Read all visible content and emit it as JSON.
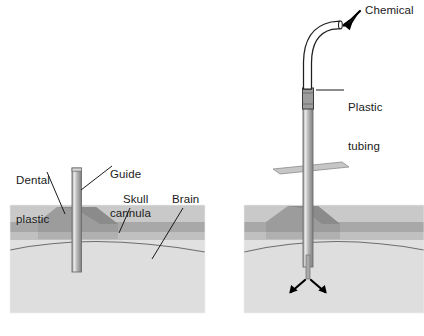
{
  "figure": {
    "panels": [
      {
        "id": "left",
        "name": "implanted-guide-cannula"
      },
      {
        "id": "right",
        "name": "infusion-cannula-with-tubing"
      }
    ]
  },
  "labels": {
    "dental_plastic": "Dental\nplastic",
    "dental_plastic_line1": "Dental",
    "dental_plastic_line2": "plastic",
    "guide_cannula_line1": "Guide",
    "guide_cannula_line2": "cannula",
    "skull": "Skull",
    "brain": "Brain",
    "chemical": "Chemical",
    "plastic_tubing_line1": "Plastic",
    "plastic_tubing_line2": "tubing"
  },
  "colors": {
    "background": "#ffffff",
    "text": "#1a1a1a",
    "leader_line": "#1a1a1a",
    "tissue_top": "#c9c9c9",
    "skull_band": "#a8a8a8",
    "subskull_band": "#bdbdbd",
    "brain_fill": "#dcdcdc",
    "block_face": "#e2e2e2",
    "dental_plastic": "#9a9a9a",
    "dental_plastic_shadow": "#8e8e8e",
    "cannula_fill": "#b5b5b5",
    "cannula_highlight": "#e6e6e6",
    "cannula_edge": "#6e6e6e",
    "tubing_outline": "#222222",
    "tubing_fill": "#ffffff",
    "connector_fill": "#9b9b9b",
    "plate_fill": "#c4c4c4",
    "plate_edge": "#8a8a8a",
    "arrow": "#000000"
  },
  "geometry": {
    "canvas_width": 424,
    "canvas_height": 336,
    "left_block": {
      "x": 10,
      "y": 205,
      "w": 195,
      "h": 108
    },
    "right_block": {
      "x": 244,
      "y": 205,
      "w": 180,
      "h": 108
    }
  }
}
